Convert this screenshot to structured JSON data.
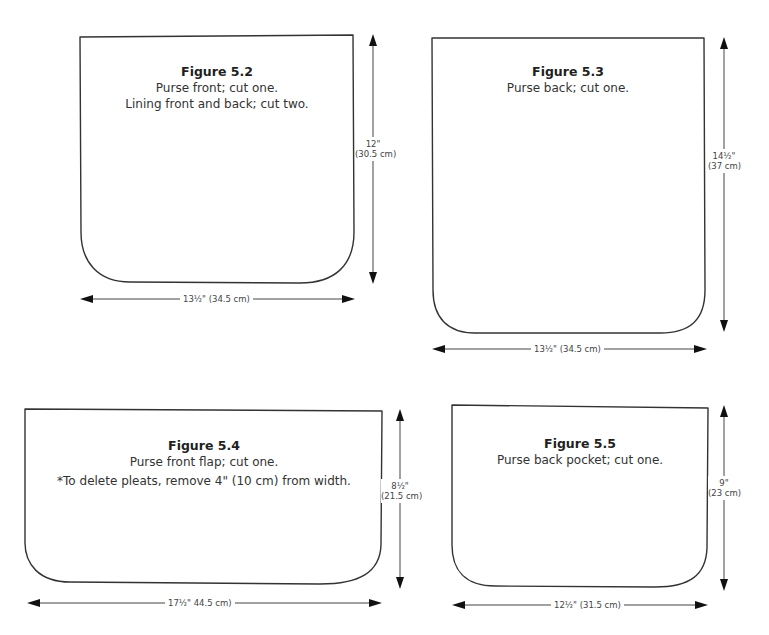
{
  "colors": {
    "outline": "#333333",
    "text": "#2b2b2b",
    "background": "#ffffff"
  },
  "figures": [
    {
      "id": "5.2",
      "title": "Figure 5.2",
      "captions": [
        "Purse front; cut one.",
        "Lining front and back; cut two."
      ],
      "height_label": [
        "12\"",
        "(30.5 cm)"
      ],
      "width_label": "13½\" (34.5 cm)"
    },
    {
      "id": "5.3",
      "title": "Figure 5.3",
      "captions": [
        "Purse back; cut one."
      ],
      "height_label": [
        "14½\"",
        "(37 cm)"
      ],
      "width_label": "13½\" (34.5 cm)"
    },
    {
      "id": "5.4",
      "title": "Figure 5.4",
      "captions": [
        "Purse front flap; cut one.",
        "*To delete pleats, remove 4\" (10 cm) from width."
      ],
      "height_label": [
        "8½\"",
        "(21.5 cm)"
      ],
      "width_label": "17½\" 44.5 cm)"
    },
    {
      "id": "5.5",
      "title": "Figure 5.5",
      "captions": [
        "Purse back pocket; cut one."
      ],
      "height_label": [
        "9\"",
        "(23 cm)"
      ],
      "width_label": "12½\" (31.5 cm)"
    }
  ]
}
